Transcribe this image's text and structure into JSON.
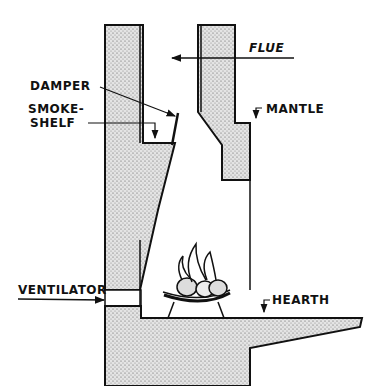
{
  "diagram": {
    "labels": {
      "flue": "FLUE",
      "damper": "DAMPER",
      "smoke_shelf_line1": "SMOKE-",
      "smoke_shelf_line2": "SHELF",
      "mantle": "MANTLE",
      "ventilator": "VENTILATOR",
      "hearth": "HEARTH"
    },
    "colors": {
      "ink": "#111111",
      "stipple": "#cfcfcf",
      "background": "#ffffff"
    }
  }
}
